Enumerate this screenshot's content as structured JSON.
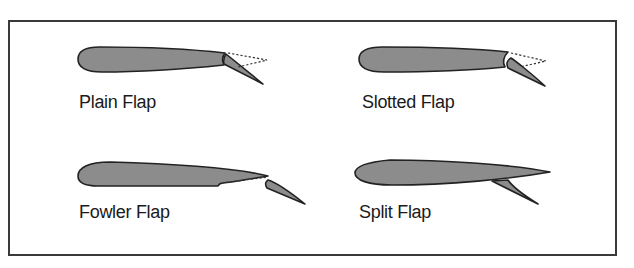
{
  "figure": {
    "panels": [
      {
        "id": "plain",
        "label": "Plain Flap"
      },
      {
        "id": "slotted",
        "label": "Slotted Flap"
      },
      {
        "id": "fowler",
        "label": "Fowler Flap"
      },
      {
        "id": "split",
        "label": "Split Flap"
      }
    ]
  },
  "colors": {
    "airfoil_fill": "#8c8c8c",
    "outline": "#222222",
    "frame": "#3a3a3a",
    "background": "#ffffff"
  }
}
